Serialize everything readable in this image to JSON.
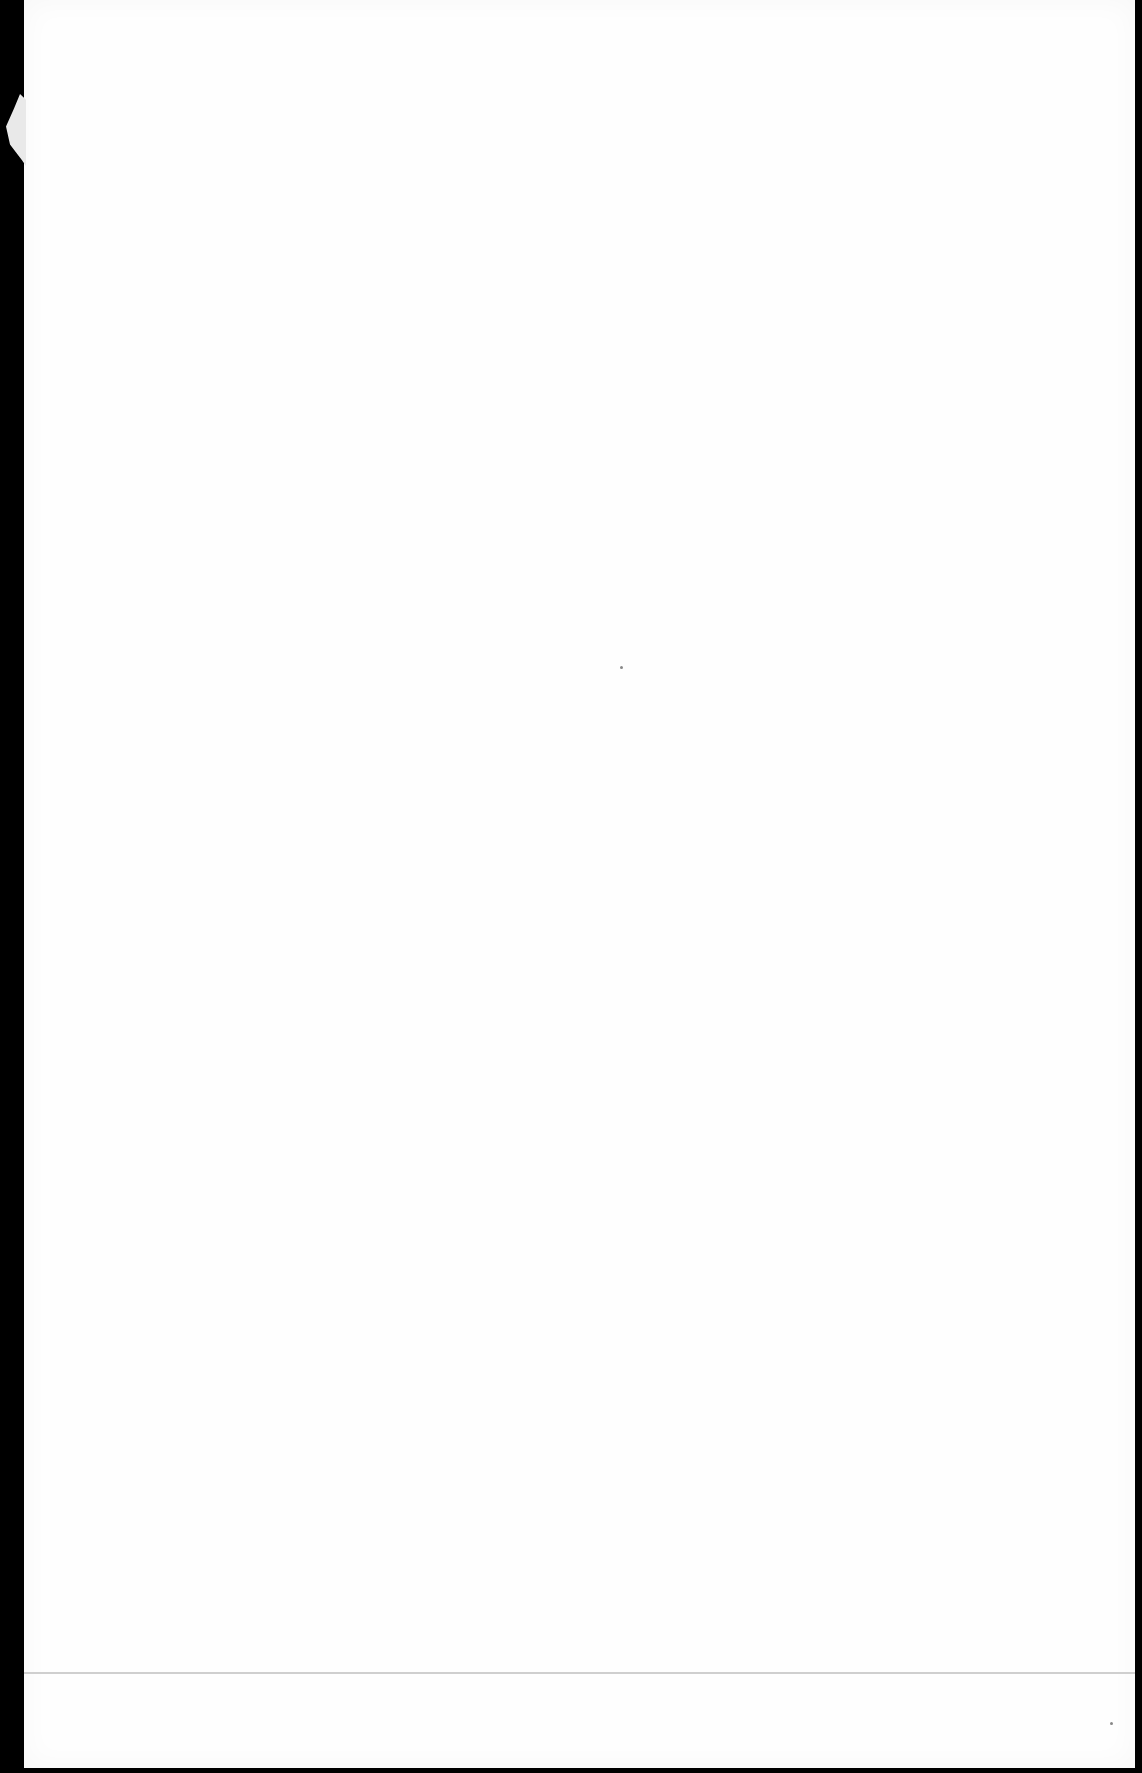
{
  "document": {
    "type": "blank scanned page",
    "text": "",
    "colors": {
      "paper": "#fefefe",
      "border": "#000000",
      "rule": "#cfcfcf"
    }
  }
}
